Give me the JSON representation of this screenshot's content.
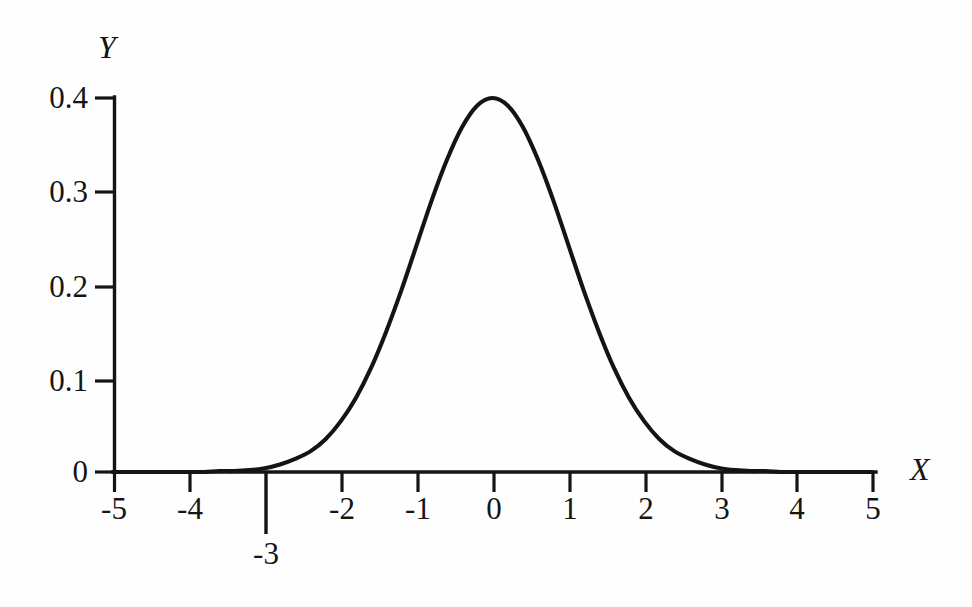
{
  "chart_data": {
    "type": "line",
    "title": "",
    "subtitle": "",
    "xlabel": "X",
    "ylabel": "Y",
    "xlim": [
      -5,
      5
    ],
    "ylim": [
      0,
      0.4
    ],
    "grid": false,
    "legend": null,
    "x_ticks": [
      -5,
      -4,
      -3,
      -2,
      -1,
      0,
      1,
      2,
      3,
      4,
      5
    ],
    "x_tick_labels": [
      "-5",
      "-4",
      "-3",
      "-2",
      "-1",
      "0",
      "1",
      "2",
      "3",
      "4",
      "5"
    ],
    "y_ticks": [
      0,
      0.1,
      0.2,
      0.3,
      0.4
    ],
    "y_tick_labels": [
      "0",
      "0.1",
      "0.2",
      "0.3",
      "0.4"
    ],
    "annotations": [
      {
        "name": "marker-at-minus-3",
        "label": "-3",
        "x": -3,
        "description": "extended vertical tick below axis at x = -3"
      }
    ],
    "series": [
      {
        "name": "standard normal density",
        "x": [
          -5.0,
          -4.8,
          -4.6,
          -4.4,
          -4.2,
          -4.0,
          -3.8,
          -3.6,
          -3.4,
          -3.2,
          -3.0,
          -2.8,
          -2.6,
          -2.4,
          -2.2,
          -2.0,
          -1.8,
          -1.6,
          -1.4,
          -1.2,
          -1.0,
          -0.8,
          -0.6,
          -0.4,
          -0.2,
          0.0,
          0.2,
          0.4,
          0.6,
          0.8,
          1.0,
          1.2,
          1.4,
          1.6,
          1.8,
          2.0,
          2.2,
          2.4,
          2.6,
          2.8,
          3.0,
          3.2,
          3.4,
          3.6,
          3.8,
          4.0,
          4.2,
          4.4,
          4.6,
          4.8,
          5.0
        ],
        "y": [
          0.0,
          0.0,
          0.0,
          0.0,
          0.0,
          0.0,
          0.0,
          0.001,
          0.001,
          0.002,
          0.004,
          0.008,
          0.014,
          0.022,
          0.035,
          0.054,
          0.079,
          0.111,
          0.15,
          0.194,
          0.242,
          0.29,
          0.333,
          0.368,
          0.391,
          0.399,
          0.391,
          0.368,
          0.333,
          0.29,
          0.242,
          0.194,
          0.15,
          0.111,
          0.079,
          0.054,
          0.035,
          0.022,
          0.014,
          0.008,
          0.004,
          0.002,
          0.001,
          0.001,
          0.0,
          0.0,
          0.0,
          0.0,
          0.0,
          0.0,
          0.0
        ]
      }
    ],
    "peak": {
      "x": 0,
      "y": 0.399
    },
    "colors": {
      "curve": "#141414",
      "axis": "#141414",
      "background": "#fefefe"
    }
  }
}
